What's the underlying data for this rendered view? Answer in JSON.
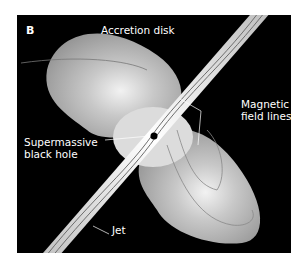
{
  "figure": {
    "panel_label": "B",
    "labels": {
      "accretion_disk": "Accretion disk",
      "magnetic_field_lines": "Magnetic\nfield lines",
      "black_hole": "Supermassive\nblack hole",
      "jet": "Jet"
    },
    "colors": {
      "background": "#000000",
      "disk": "#9a9a9a",
      "jet": "#e8e8e8",
      "field_line": "#6a6a6a",
      "page": "#ffffff"
    }
  }
}
